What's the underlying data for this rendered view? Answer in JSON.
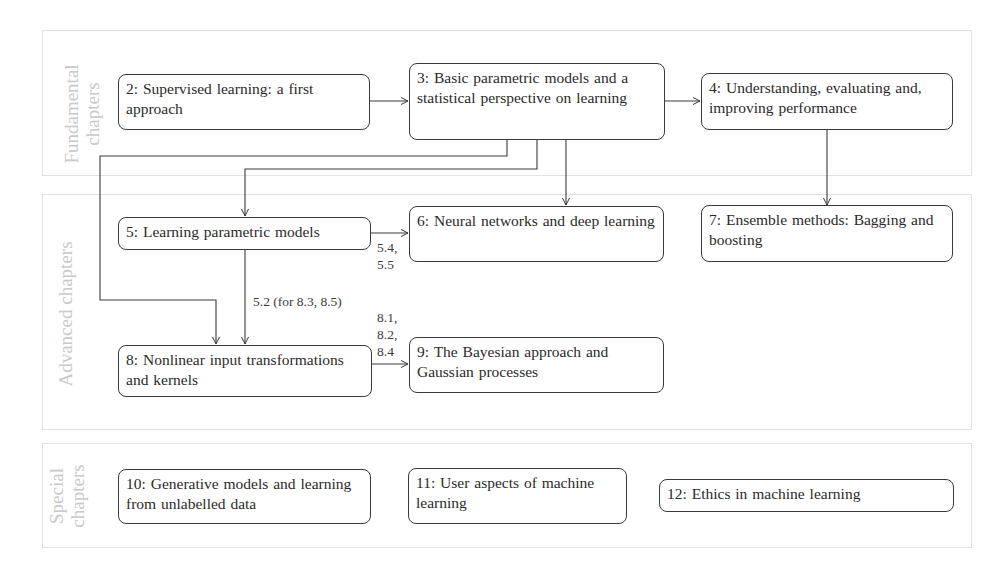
{
  "sections": [
    {
      "id": "fundamental",
      "label_line1": "Fundamental",
      "label_line2": "chapters"
    },
    {
      "id": "advanced",
      "label_line1": "Advanced chapters",
      "label_line2": ""
    },
    {
      "id": "special",
      "label_line1": "Special",
      "label_line2": "chapters"
    }
  ],
  "nodes": {
    "ch2": "2: Supervised learning: a first approach",
    "ch3": "3: Basic parametric models and a statistical perspective on learning",
    "ch4": "4: Understanding, evaluating and, improving performance",
    "ch5": "5: Learning parametric models",
    "ch6": "6: Neural networks and deep learning",
    "ch7": "7: Ensemble methods: Bagging and boosting",
    "ch8": "8: Nonlinear input transformations and kernels",
    "ch9": "9: The Bayesian approach and Gaussian processes",
    "ch10": "10: Generative models and learning from unlabelled data",
    "ch11": "11: User aspects of machine learning",
    "ch12": "12: Ethics in machine learning"
  },
  "edges": [
    {
      "from": "ch2",
      "to": "ch3",
      "label": ""
    },
    {
      "from": "ch3",
      "to": "ch4",
      "label": ""
    },
    {
      "from": "ch3",
      "to": "ch5",
      "label": ""
    },
    {
      "from": "ch3",
      "to": "ch6",
      "label": ""
    },
    {
      "from": "ch3",
      "to": "ch8",
      "label": ""
    },
    {
      "from": "ch4",
      "to": "ch7",
      "label": ""
    },
    {
      "from": "ch5",
      "to": "ch6",
      "label": "5.4, 5.5"
    },
    {
      "from": "ch5",
      "to": "ch8",
      "label": "5.2 (for 8.3, 8.5)"
    },
    {
      "from": "ch8",
      "to": "ch9",
      "label": "8.1, 8.2, 8.4"
    }
  ],
  "edge_labels": {
    "e56_line1": "5.4,",
    "e56_line2": "5.5",
    "e58": "5.2 (for 8.3, 8.5)",
    "e89_line1": "8.1,",
    "e89_line2": "8.2,",
    "e89_line3": "8.4"
  },
  "colors": {
    "section_border": "#e2e2e2",
    "section_label": "#c9c9c9",
    "node_border": "#3a3a3a",
    "text": "#2a2a2a"
  }
}
